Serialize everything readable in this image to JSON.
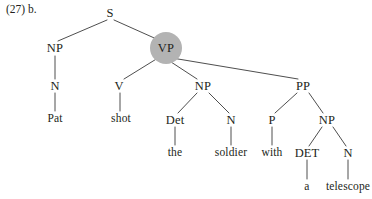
{
  "figure": {
    "example_label": "(27) b.",
    "background_color": "#ffffff",
    "line_color": "#3a3a3a",
    "text_color": "#231f20",
    "highlight_color": "#b3b3b3"
  },
  "tree": {
    "type": "constituency-syntax-tree",
    "sentence": "Pat shot the soldier with a telescope",
    "highlighted_node": "VP",
    "nodes": [
      {
        "id": "S",
        "label": "S",
        "kind": "category",
        "x": 110,
        "y": 13,
        "highlighted": false
      },
      {
        "id": "NP1",
        "label": "NP",
        "kind": "category",
        "x": 55,
        "y": 48,
        "highlighted": false
      },
      {
        "id": "VP",
        "label": "VP",
        "kind": "category",
        "x": 166,
        "y": 48,
        "highlighted": true
      },
      {
        "id": "N1",
        "label": "N",
        "kind": "category",
        "x": 55,
        "y": 86,
        "highlighted": false
      },
      {
        "id": "V",
        "label": "V",
        "kind": "category",
        "x": 119,
        "y": 86,
        "highlighted": false
      },
      {
        "id": "NP2",
        "label": "NP",
        "kind": "category",
        "x": 203,
        "y": 86,
        "highlighted": false
      },
      {
        "id": "PP",
        "label": "PP",
        "kind": "category",
        "x": 303,
        "y": 86,
        "highlighted": false
      },
      {
        "id": "Det",
        "label": "Det",
        "kind": "category",
        "x": 175,
        "y": 120,
        "highlighted": false
      },
      {
        "id": "N2",
        "label": "N",
        "kind": "category",
        "x": 231,
        "y": 120,
        "highlighted": false
      },
      {
        "id": "P",
        "label": "P",
        "kind": "category",
        "x": 272,
        "y": 120,
        "highlighted": false
      },
      {
        "id": "NP3",
        "label": "NP",
        "kind": "category",
        "x": 327,
        "y": 120,
        "highlighted": false
      },
      {
        "id": "w_pat",
        "label": "Pat",
        "kind": "terminal",
        "x": 55,
        "y": 119,
        "highlighted": false
      },
      {
        "id": "w_shot",
        "label": "shot",
        "kind": "terminal",
        "x": 121,
        "y": 119,
        "highlighted": false
      },
      {
        "id": "w_the",
        "label": "the",
        "kind": "terminal",
        "x": 175,
        "y": 153,
        "highlighted": false
      },
      {
        "id": "w_soldier",
        "label": "soldier",
        "kind": "terminal",
        "x": 231,
        "y": 153,
        "highlighted": false
      },
      {
        "id": "w_with",
        "label": "with",
        "kind": "terminal",
        "x": 272,
        "y": 153,
        "highlighted": false
      },
      {
        "id": "DET2",
        "label": "DET",
        "kind": "category",
        "x": 307,
        "y": 153,
        "highlighted": false
      },
      {
        "id": "N3",
        "label": "N",
        "kind": "category",
        "x": 348,
        "y": 153,
        "highlighted": false
      },
      {
        "id": "w_a",
        "label": "a",
        "kind": "terminal",
        "x": 307,
        "y": 187,
        "highlighted": false
      },
      {
        "id": "w_telescope",
        "label": "telescope",
        "kind": "terminal",
        "x": 348,
        "y": 187,
        "highlighted": false
      }
    ],
    "edges": [
      {
        "from": "S",
        "to": "NP1",
        "x1": 107,
        "y1": 20,
        "x2": 58,
        "y2": 41
      },
      {
        "from": "S",
        "to": "VP",
        "x1": 114,
        "y1": 20,
        "x2": 161,
        "y2": 41
      },
      {
        "from": "NP1",
        "to": "N1",
        "x1": 55,
        "y1": 56,
        "x2": 55,
        "y2": 79
      },
      {
        "from": "N1",
        "to": "w_pat",
        "x1": 55,
        "y1": 93,
        "x2": 55,
        "y2": 111
      },
      {
        "from": "VP",
        "to": "V",
        "x1": 158,
        "y1": 58,
        "x2": 124,
        "y2": 79
      },
      {
        "from": "VP",
        "to": "NP2",
        "x1": 168,
        "y1": 60,
        "x2": 197,
        "y2": 79
      },
      {
        "from": "VP",
        "to": "PP",
        "x1": 172,
        "y1": 58,
        "x2": 298,
        "y2": 79
      },
      {
        "from": "V",
        "to": "w_shot",
        "x1": 120,
        "y1": 93,
        "x2": 120,
        "y2": 111
      },
      {
        "from": "NP2",
        "to": "Det",
        "x1": 197,
        "y1": 93,
        "x2": 178,
        "y2": 113
      },
      {
        "from": "NP2",
        "to": "N2",
        "x1": 209,
        "y1": 93,
        "x2": 229,
        "y2": 113
      },
      {
        "from": "Det",
        "to": "w_the",
        "x1": 175,
        "y1": 127,
        "x2": 175,
        "y2": 145
      },
      {
        "from": "N2",
        "to": "w_soldier",
        "x1": 231,
        "y1": 127,
        "x2": 231,
        "y2": 145
      },
      {
        "from": "PP",
        "to": "P",
        "x1": 297,
        "y1": 93,
        "x2": 275,
        "y2": 113
      },
      {
        "from": "PP",
        "to": "NP3",
        "x1": 309,
        "y1": 93,
        "x2": 323,
        "y2": 113
      },
      {
        "from": "P",
        "to": "w_with",
        "x1": 272,
        "y1": 127,
        "x2": 272,
        "y2": 145
      },
      {
        "from": "NP3",
        "to": "DET2",
        "x1": 322,
        "y1": 127,
        "x2": 309,
        "y2": 146
      },
      {
        "from": "NP3",
        "to": "N3",
        "x1": 333,
        "y1": 127,
        "x2": 346,
        "y2": 146
      },
      {
        "from": "DET2",
        "to": "w_a",
        "x1": 307,
        "y1": 160,
        "x2": 307,
        "y2": 179
      },
      {
        "from": "N3",
        "to": "w_telescope",
        "x1": 348,
        "y1": 160,
        "x2": 348,
        "y2": 179
      }
    ],
    "highlight": {
      "cx": 166,
      "cy": 48,
      "r": 16
    }
  }
}
